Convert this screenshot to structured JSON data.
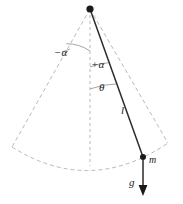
{
  "figure": {
    "colors": {
      "solid_line": "#2b2b2b",
      "dashed_line": "#b9b9b9",
      "arc_line": "#8a8a8a",
      "label_text": "#1a1a1a",
      "background": "#ffffff"
    },
    "labels": {
      "alpha_negative": "−α",
      "alpha_positive": "+α",
      "theta": "θ",
      "length": "l",
      "mass": "m",
      "gravity": "g"
    },
    "geometry": {
      "pivot": {
        "x": 90,
        "y": 9
      },
      "bob": {
        "x": 143,
        "y": 157
      },
      "rod_length_px": 157,
      "vertical_axis_x": 90,
      "vertical_axis_bottom_y": 166,
      "cone_left_edge_end": {
        "x": 12,
        "y": 147
      },
      "cone_right_edge_end": {
        "x": 168,
        "y": 143
      },
      "gravity_arrow_start": {
        "x": 143,
        "y": 160
      },
      "gravity_arrow_end": {
        "x": 143,
        "y": 196
      },
      "angle_arcs": [
        {
          "name": "minus-alpha",
          "radius": 42
        },
        {
          "name": "plus-alpha",
          "radius": 58
        },
        {
          "name": "theta",
          "radius": 80
        }
      ]
    }
  }
}
